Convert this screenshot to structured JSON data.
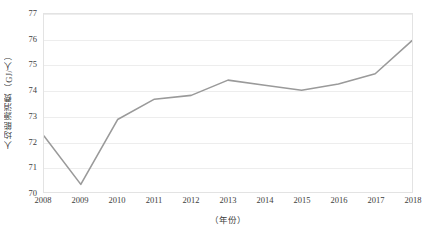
{
  "chart_data": {
    "type": "line",
    "title": "",
    "subtitle": "",
    "xlabel": "（年份）",
    "ylabel": "人均能源消费（GJ/人）",
    "categories": [
      "2008",
      "2009",
      "2010",
      "2011",
      "2012",
      "2013",
      "2014",
      "2015",
      "2016",
      "2017",
      "2018"
    ],
    "x": [
      2008,
      2009,
      2010,
      2011,
      2012,
      2013,
      2014,
      2015,
      2016,
      2017,
      2018
    ],
    "values": [
      72.2,
      70.3,
      72.85,
      73.65,
      73.8,
      74.4,
      74.2,
      74.0,
      74.25,
      74.65,
      75.95
    ],
    "series": [
      {
        "name": "人均能源消费",
        "values": [
          72.2,
          70.3,
          72.85,
          73.65,
          73.8,
          74.4,
          74.2,
          74.0,
          74.25,
          74.65,
          75.95
        ]
      }
    ],
    "ylim": [
      70,
      77
    ],
    "xlim": [
      2008,
      2018
    ],
    "yticks": [
      70,
      71,
      72,
      73,
      74,
      75,
      76,
      77
    ],
    "ytick_labels": [
      "70",
      "71",
      "72",
      "73",
      "74",
      "75",
      "76",
      "77"
    ],
    "xticks": [
      2008,
      2009,
      2010,
      2011,
      2012,
      2013,
      2014,
      2015,
      2016,
      2017,
      2018
    ],
    "xtick_labels": [
      "2008",
      "2009",
      "2010",
      "2011",
      "2012",
      "2013",
      "2014",
      "2015",
      "2016",
      "2017",
      "2018"
    ],
    "grid": "horizontal",
    "legend": "none",
    "line_color": "#9a9a9a",
    "grid_color": "#ededed",
    "border_color": "#e3e3e3",
    "text_color": "#3d3d3d",
    "background": "#ffffff",
    "markers": false,
    "line_width": 1.6,
    "annotations": []
  }
}
